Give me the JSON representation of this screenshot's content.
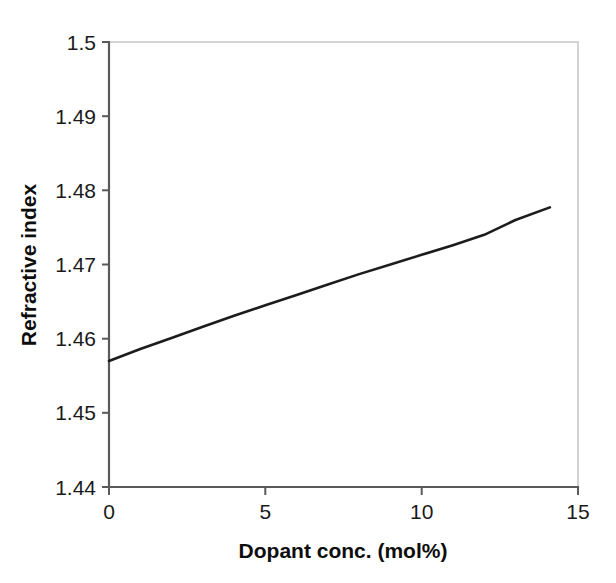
{
  "chart_data": {
    "type": "line",
    "title": "",
    "xlabel": "Dopant conc. (mol%)",
    "ylabel": "Refractive index",
    "xlim": [
      0,
      15
    ],
    "ylim": [
      1.44,
      1.5
    ],
    "xticks": [
      "0",
      "5",
      "10",
      "15"
    ],
    "xtick_values": [
      0,
      5,
      10,
      15
    ],
    "yticks": [
      "1.44",
      "1.45",
      "1.46",
      "1.47",
      "1.48",
      "1.49",
      "1.5"
    ],
    "ytick_values": [
      1.44,
      1.45,
      1.46,
      1.47,
      1.48,
      1.49,
      1.5
    ],
    "grid": false,
    "legend": "none",
    "series": [
      {
        "name": "Refractive index vs dopant concentration",
        "color": "#1c1c1c",
        "x": [
          0,
          1,
          2,
          3,
          4,
          5,
          6,
          7,
          8,
          9,
          10,
          11,
          12,
          13,
          14.1
        ],
        "values": [
          1.457,
          1.4586,
          1.4601,
          1.4616,
          1.4631,
          1.4645,
          1.4659,
          1.4673,
          1.4687,
          1.47,
          1.4713,
          1.4726,
          1.474,
          1.476,
          1.4777
        ]
      }
    ]
  },
  "axes": {
    "x_title": "Dopant conc. (mol%)",
    "y_title": "Refractive index"
  },
  "colors": {
    "series": "#1c1c1c",
    "axis": "#5a5a5a",
    "frame": "#c8c8c8",
    "text": "#1a1a1a",
    "background": "#ffffff"
  }
}
